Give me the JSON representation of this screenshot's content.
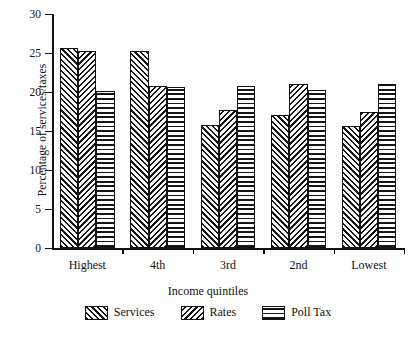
{
  "chart_data": {
    "type": "bar",
    "title": "",
    "xlabel": "Income quintiles",
    "ylabel": "Percentage of services/taxes",
    "categories": [
      "Highest",
      "4th",
      "3rd",
      "2nd",
      "Lowest"
    ],
    "series": [
      {
        "name": "Services",
        "pattern": "diagonal-up-hatch",
        "values": [
          25.6,
          25.2,
          15.8,
          17.1,
          15.7
        ]
      },
      {
        "name": "Rates",
        "pattern": "diagonal-down-hatch",
        "values": [
          25.2,
          20.8,
          17.7,
          21.0,
          17.4
        ]
      },
      {
        "name": "Poll Tax",
        "pattern": "horizontal-lines",
        "values": [
          20.1,
          20.6,
          20.8,
          20.3,
          21.0
        ]
      }
    ],
    "ylim": [
      0,
      30
    ],
    "yticks": [
      0,
      5,
      10,
      15,
      20,
      25,
      30
    ],
    "ytick_labels": [
      "0",
      "5",
      "10",
      "15",
      "20",
      "25",
      "30"
    ],
    "grid": false,
    "legend_position": "bottom"
  },
  "legend": {
    "items": [
      {
        "label": "Services"
      },
      {
        "label": "Rates"
      },
      {
        "label": "Poll Tax"
      }
    ]
  },
  "colors": {
    "ink": "#111111",
    "background": "#ffffff"
  }
}
